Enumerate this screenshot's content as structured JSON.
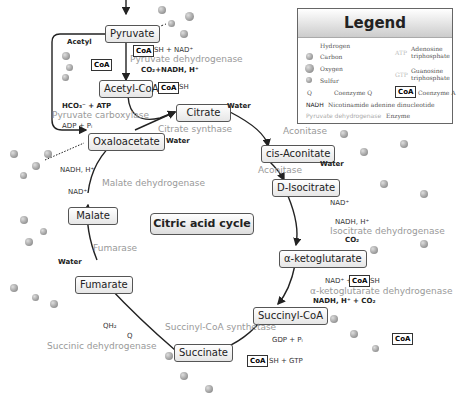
{
  "title": "Citric acid cycle",
  "legend": {
    "title": "Legend",
    "items": [
      {
        "symbol": "hydrogen",
        "label": "Hydrogen"
      },
      {
        "symbol": "carbon",
        "label": "Carbon"
      },
      {
        "symbol": "oxygen",
        "label": "Oxygen"
      },
      {
        "symbol": "sulfur",
        "label": "Sulfur"
      },
      {
        "symbol": "Q",
        "label": "Coenzyme Q"
      },
      {
        "symbol": "ATP",
        "label": "Adenosine triphosphate"
      },
      {
        "symbol": "GTP",
        "label": "Guanosine triphosphate"
      },
      {
        "symbol": "CoA",
        "label": "Coenzyme A"
      },
      {
        "symbol": "NADH",
        "label": "Nicotinamide adenine dinucleotide"
      },
      {
        "symbol": "Pyruvate dehydrogenase",
        "label": "Enzyme"
      }
    ]
  },
  "nodes": {
    "pyruvate": "Pyruvate",
    "acetyl_coa": "Acetyl-CoA",
    "citrate": "Citrate",
    "cis_aconitate": "cis-Aconitate",
    "d_isocitrate": "D-Isocitrate",
    "a_ketoglutarate": "α-ketoglutarate",
    "succinyl_coa": "Succinyl-CoA",
    "succinate": "Succinate",
    "fumarate": "Fumarate",
    "malate": "Malate",
    "oxaloacetate": "Oxaloacetate"
  },
  "enzymes": {
    "pyruvate_dehydrogenase": "Pyruvate dehydrogenase",
    "pyruvate_carboxylase": "Pyruvate carboxylase",
    "citrate_synthase": "Citrate synthase",
    "aconitase1": "Aconitase",
    "aconitase2": "Aconitase",
    "isocitrate_dehydrogenase": "Isocitrate dehydrogenase",
    "akg_dehydrogenase": "α-ketoglutarate dehydrogenase",
    "succinyl_coa_synthetase": "Succinyl-CoA synthetase",
    "succinic_dehydrogenase": "Succinic dehydrogenase",
    "fumarase": "Fumarase",
    "malate_dehydrogenase": "Malate dehydrogenase"
  },
  "labels": {
    "acetyl": "Acetyl",
    "coa": "CoA",
    "sh_nad": "SH + NAD⁺",
    "co2_nadh": "CO₂+NADH, H⁺",
    "sh": "SH",
    "hco3_atp": "HCO₃⁻ + ATP",
    "adp_pi": "ADP + Pᵢ",
    "water": "Water",
    "nad": "NAD⁺",
    "nadh_h": "NADH, H⁺",
    "co2": "CO₂",
    "nad_plus": "NAD⁺ +",
    "nadh_co2": "NADH, H⁺ + CO₂",
    "gdp_pi": "GDP + Pᵢ",
    "sh_gtp": "SH +  GTP",
    "qh2": "QH₂",
    "q": "Q"
  }
}
